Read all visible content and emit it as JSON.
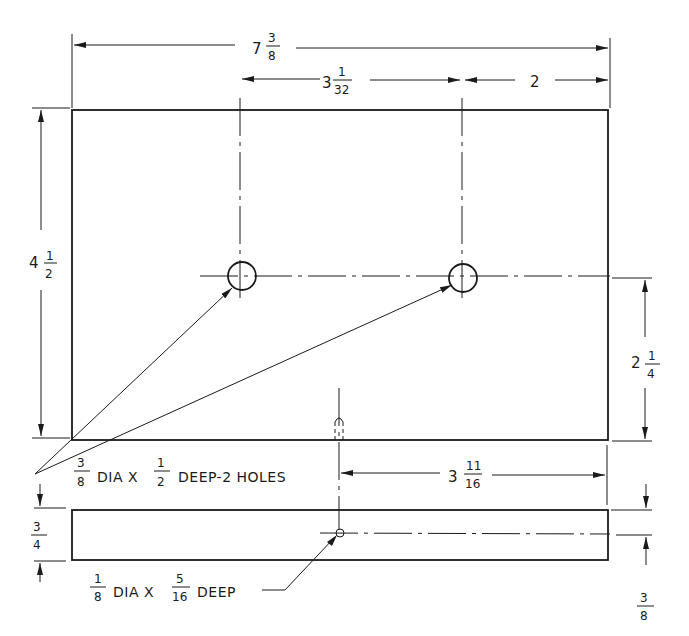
{
  "drawing": {
    "title": "Machined block with two drilled holes - orthographic views",
    "units": "inches",
    "views": [
      "top view",
      "front (edge) view"
    ],
    "dimensions": {
      "overall_length": {
        "whole": "7",
        "num": "3",
        "den": "8",
        "value": 7.375
      },
      "hole_spacing": {
        "whole": "3",
        "num": "1",
        "den": "32",
        "value": 3.03125
      },
      "hole_to_right_edge": {
        "whole": "2",
        "value": 2
      },
      "overall_width": {
        "whole": "4",
        "num": "1",
        "den": "2",
        "value": 4.5
      },
      "hole_row_from_bottom": {
        "whole": "2",
        "num": "1",
        "den": "4",
        "value": 2.25
      },
      "small_hole_from_right": {
        "whole": "3",
        "num": "11",
        "den": "16",
        "value": 3.6875
      },
      "thickness": {
        "num": "3",
        "den": "4",
        "value": 0.75
      },
      "small_hole_height": {
        "num": "3",
        "den": "8",
        "value": 0.375
      }
    },
    "notes": {
      "large_holes": {
        "num": "3",
        "den": "8",
        "text1": "DIA X",
        "num2": "1",
        "den2": "2",
        "text2": "DEEP-2 HOLES"
      },
      "small_hole": {
        "num": "1",
        "den": "8",
        "text1": "DIA X",
        "num2": "5",
        "den2": "16",
        "text2": "DEEP"
      }
    }
  }
}
